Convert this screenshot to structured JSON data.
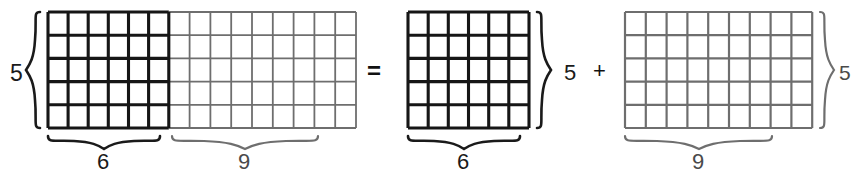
{
  "diagram": {
    "equation_operators": {
      "equals": "=",
      "plus": "+"
    },
    "arrays": [
      {
        "id": "combined-array",
        "name": "combined-array",
        "rows": 5,
        "columns": 15,
        "row_label": "5",
        "column_labels": [
          "6",
          "9"
        ],
        "segments": [
          {
            "name": "dark-segment",
            "columns": 6,
            "label": "6",
            "emphasis": "bold",
            "color": "#161616"
          },
          {
            "name": "light-segment",
            "columns": 9,
            "label": "9",
            "emphasis": "light",
            "color": "#6e6e6e"
          }
        ]
      },
      {
        "id": "first-partial-array",
        "name": "first-partial-array",
        "rows": 5,
        "columns": 6,
        "row_label": "5",
        "column_label": "6",
        "emphasis": "bold",
        "color": "#161616"
      },
      {
        "id": "second-partial-array",
        "name": "second-partial-array",
        "rows": 5,
        "columns": 9,
        "row_label": "5",
        "column_label": "9",
        "emphasis": "light",
        "color": "#6e6e6e"
      }
    ],
    "labels": {
      "combined_rows": "5",
      "combined_cols_dark": "6",
      "combined_cols_light": "9",
      "equals": "=",
      "first_rows": "5",
      "first_cols": "6",
      "plus": "+",
      "second_rows": "5",
      "second_cols": "9"
    },
    "colors": {
      "background": "#ffffff",
      "bold_stroke": "#161616",
      "light_stroke": "#6e6e6e",
      "bold_brace": "#1a1a1a",
      "light_brace": "#6e6e6e",
      "text": "#1a1a1a"
    }
  }
}
